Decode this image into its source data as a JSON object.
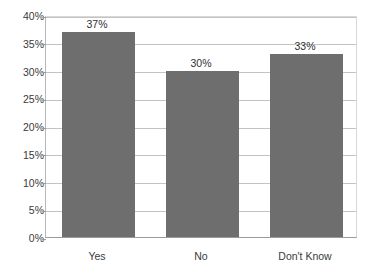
{
  "chart_data": {
    "type": "bar",
    "title": "",
    "xlabel": "",
    "ylabel": "",
    "categories": [
      "Yes",
      "No",
      "Don't Know"
    ],
    "values": [
      37,
      30,
      33
    ],
    "value_labels": [
      "37%",
      "30%",
      "33%"
    ],
    "ylim": [
      0,
      40
    ],
    "ytick_step": 5,
    "ytick_labels": [
      "0%",
      "5%",
      "10%",
      "15%",
      "20%",
      "25%",
      "30%",
      "35%",
      "40%"
    ],
    "ytick_values": [
      0,
      5,
      10,
      15,
      20,
      25,
      30,
      35,
      40
    ],
    "grid": true,
    "legend": "none",
    "series": [
      {
        "name": "Response share",
        "values": [
          37,
          30,
          33
        ]
      }
    ],
    "colors": {
      "bar_fill": "#6e6e6e",
      "gridline": "#c3c3c3",
      "axis": "#9a9a9a",
      "text": "#3a3a3a",
      "background": "#ffffff"
    }
  }
}
